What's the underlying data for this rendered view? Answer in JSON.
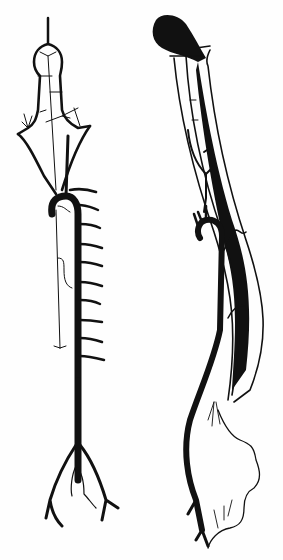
{
  "figure": {
    "background_color": "#fefefe",
    "ink_color": "#111111",
    "panels": [
      {
        "id": "left",
        "subject": "ventral view: branching vessel with segmental side branches and bifurcation at bottom"
      },
      {
        "id": "right",
        "subject": "lateral view: curved vessel with filled dark tube and wavy lower branch"
      }
    ]
  }
}
